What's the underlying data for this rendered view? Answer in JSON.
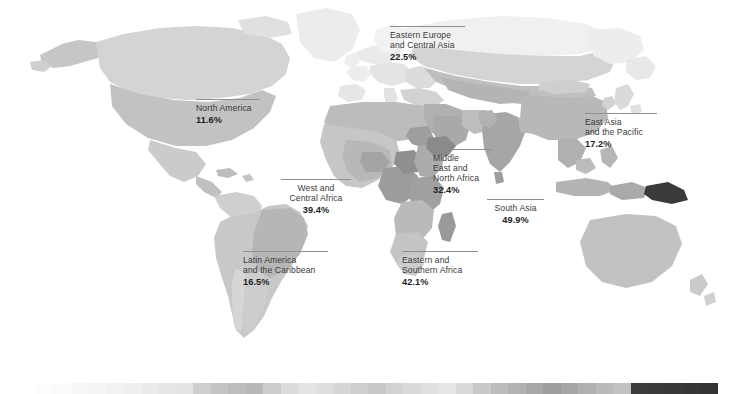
{
  "figure": {
    "type": "choropleth-map",
    "palette": {
      "background": "#ffffff",
      "land_lightest": "#f0f0f0",
      "land_light": "#e2e2e2",
      "land_mid": "#cfcfcf",
      "land_mid_dark": "#b4b4b4",
      "land_dark": "#9a9a9a",
      "land_darkest": "#6f6f6f",
      "land_extreme": "#3a3a3a",
      "label_text": "#3a3a3a",
      "label_value": "#1e1e1e",
      "rule": "#8f8f8f"
    }
  },
  "labels": [
    {
      "id": "north-america",
      "name_lines": [
        "North America"
      ],
      "value": "11.6%",
      "align": "left",
      "x": 196,
      "y": 99,
      "w": 64
    },
    {
      "id": "eastern-europe-central-asia",
      "name_lines": [
        "Eastern Europe",
        "and Central Asia"
      ],
      "value": "22.5%",
      "align": "left",
      "x": 390,
      "y": 26,
      "w": 75
    },
    {
      "id": "east-asia-pacific",
      "name_lines": [
        "East Asia",
        "and the Pacific"
      ],
      "value": "17.2%",
      "align": "left",
      "x": 585,
      "y": 113,
      "w": 72
    },
    {
      "id": "middle-east-north-africa",
      "name_lines": [
        "Middle",
        "East and",
        "North Africa"
      ],
      "value": "32.4%",
      "align": "left",
      "x": 433,
      "y": 149,
      "w": 59
    },
    {
      "id": "south-asia",
      "name_lines": [
        "South Asia"
      ],
      "value": "49.9%",
      "align": "center",
      "x": 487,
      "y": 199,
      "w": 57
    },
    {
      "id": "west-central-africa",
      "name_lines": [
        "West and",
        "Central Africa"
      ],
      "value": "39.4%",
      "align": "center",
      "x": 281,
      "y": 179,
      "w": 70
    },
    {
      "id": "eastern-southern-africa",
      "name_lines": [
        "Eastern and",
        "Southern Africa"
      ],
      "value": "42.1%",
      "align": "left",
      "x": 402,
      "y": 251,
      "w": 76
    },
    {
      "id": "latin-america-caribbean",
      "name_lines": [
        "Latin America",
        "and the Caribbean"
      ],
      "value": "16.5%",
      "align": "left",
      "x": 243,
      "y": 251,
      "w": 85
    }
  ],
  "legend": {
    "caption": "",
    "segments": [
      "#ffffff",
      "#fdfdfd",
      "#fbfbfb",
      "#f8f8f8",
      "#f5f5f5",
      "#f2f2f2",
      "#efefef",
      "#ebebeb",
      "#e7e7e7",
      "#e3e3e3",
      "#cfcfcf",
      "#c4c4c4",
      "#bdbdbd",
      "#b8b8b8",
      "#cdcdcd",
      "#dcdcdc",
      "#e4e4e4",
      "#dedede",
      "#d6d6d6",
      "#cecece",
      "#c8c8c8",
      "#d2d2d2",
      "#dadada",
      "#e0e0e0",
      "#e6e6e6",
      "#d9d9d9",
      "#c9c9c9",
      "#bcbcbc",
      "#b2b2b2",
      "#a8a8a8",
      "#9e9e9e",
      "#a6a6a6",
      "#b0b0b0",
      "#bababa",
      "#c2c2c2",
      "#3c3c3c",
      "#3a3a3a",
      "#383838",
      "#363636",
      "#343434"
    ]
  },
  "chart_data": {
    "type": "heatmap",
    "title": "",
    "xlabel": "",
    "ylabel": "",
    "categories": [
      "North America",
      "Eastern Europe and Central Asia",
      "East Asia and the Pacific",
      "Middle East and North Africa",
      "South Asia",
      "West and Central Africa",
      "Eastern and Southern Africa",
      "Latin America and the Caribbean"
    ],
    "values": [
      11.6,
      22.5,
      17.2,
      32.4,
      49.9,
      39.4,
      42.1,
      16.5
    ],
    "value_labels": [
      "11.6%",
      "22.5%",
      "17.2%",
      "32.4%",
      "49.9%",
      "39.4%",
      "42.1%",
      "16.5%"
    ],
    "unit": "%",
    "legend_position": "bottom",
    "grid": false
  }
}
